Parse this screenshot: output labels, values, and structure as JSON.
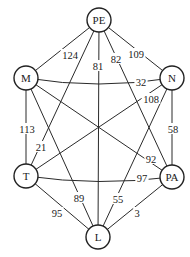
{
  "diagram": {
    "type": "weighted-graph",
    "nodes": [
      {
        "id": "PE",
        "label": "PE",
        "x": 99,
        "y": 20
      },
      {
        "id": "M",
        "label": "M",
        "x": 26,
        "y": 78
      },
      {
        "id": "N",
        "label": "N",
        "x": 172,
        "y": 78
      },
      {
        "id": "T",
        "label": "T",
        "x": 26,
        "y": 176
      },
      {
        "id": "PA",
        "label": "PA",
        "x": 172,
        "y": 177
      },
      {
        "id": "L",
        "label": "L",
        "x": 98,
        "y": 237
      }
    ],
    "edges": [
      {
        "from": "PE",
        "to": "M",
        "weight": "124",
        "lx": 70,
        "ly": 55
      },
      {
        "from": "PE",
        "to": "N",
        "weight": "109",
        "lx": 136,
        "ly": 54
      },
      {
        "from": "PE",
        "to": "L",
        "weight": "81",
        "lx": 98,
        "ly": 66
      },
      {
        "from": "PE",
        "to": "PA",
        "weight": "82",
        "lx": 116,
        "ly": 59
      },
      {
        "from": "PE",
        "to": "T",
        "weight": "21",
        "lx": 41,
        "ly": 147
      },
      {
        "from": "M",
        "to": "N",
        "weight": "32",
        "lx": 141,
        "ly": 82,
        "curve": 6
      },
      {
        "from": "M",
        "to": "T",
        "weight": "113",
        "lx": 27,
        "ly": 129
      },
      {
        "from": "M",
        "to": "L",
        "weight": "89",
        "lx": 79,
        "ly": 198
      },
      {
        "from": "M",
        "to": "PA",
        "weight": "92",
        "lx": 151,
        "ly": 159
      },
      {
        "from": "N",
        "to": "T",
        "weight": "108",
        "lx": 151,
        "ly": 99
      },
      {
        "from": "N",
        "to": "PA",
        "weight": "58",
        "lx": 173,
        "ly": 129
      },
      {
        "from": "N",
        "to": "L",
        "weight": "55",
        "lx": 118,
        "ly": 199
      },
      {
        "from": "T",
        "to": "PA",
        "weight": "97",
        "lx": 142,
        "ly": 178,
        "curve": 5
      },
      {
        "from": "T",
        "to": "L",
        "weight": "95",
        "lx": 57,
        "ly": 213
      },
      {
        "from": "PA",
        "to": "L",
        "weight": "3",
        "lx": 137,
        "ly": 213
      }
    ]
  },
  "style": {
    "node_radius": 12,
    "stroke_color": "#222222",
    "background": "#ffffff"
  }
}
